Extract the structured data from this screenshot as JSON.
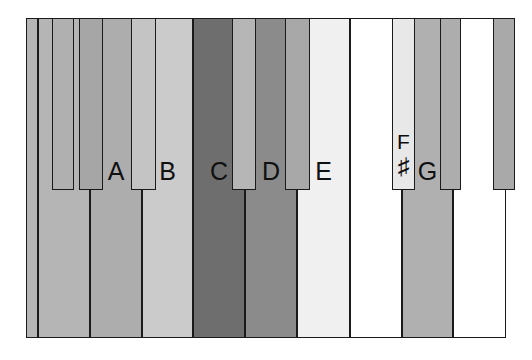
{
  "diagram": {
    "type": "piano-keyboard",
    "background_color": "#ffffff",
    "outline_color": "#1a1a1a",
    "geometry": {
      "image_width": 532,
      "image_height": 360,
      "keyboard_left": 26,
      "keyboard_right": 506,
      "keyboard_top": 18,
      "keyboard_bottom": 338,
      "black_key_bottom": 190
    },
    "white_keys": [
      {
        "id": "wk-0",
        "label": "",
        "x": 26,
        "y": 18,
        "width": 12,
        "height": 320,
        "color": "#b5b5b5"
      },
      {
        "id": "wk-1",
        "label": "G",
        "x": 38,
        "y": 18,
        "width": 52,
        "height": 320,
        "color": "#b5b5b5"
      },
      {
        "id": "wk-2",
        "label": "A",
        "x": 90,
        "y": 18,
        "width": 52,
        "height": 320,
        "color": "#adadad"
      },
      {
        "id": "wk-3",
        "label": "B",
        "x": 142,
        "y": 18,
        "width": 51,
        "height": 320,
        "color": "#cbcbcb"
      },
      {
        "id": "wk-4",
        "label": "C",
        "x": 193,
        "y": 18,
        "width": 52,
        "height": 320,
        "color": "#6e6e6e"
      },
      {
        "id": "wk-5",
        "label": "D",
        "x": 245,
        "y": 18,
        "width": 52,
        "height": 320,
        "color": "#8b8b8b"
      },
      {
        "id": "wk-6",
        "label": "E",
        "x": 297,
        "y": 18,
        "width": 53,
        "height": 320,
        "color": "#f0f0f0"
      },
      {
        "id": "wk-7",
        "label": "",
        "x": 350,
        "y": 18,
        "width": 52,
        "height": 320,
        "color": "#ffffff"
      },
      {
        "id": "wk-8",
        "label": "G",
        "x": 402,
        "y": 18,
        "width": 51,
        "height": 320,
        "color": "#b0b0b0"
      },
      {
        "id": "wk-9",
        "label": "",
        "x": 453,
        "y": 18,
        "width": 53,
        "height": 320,
        "color": "#ffffff"
      }
    ],
    "black_keys": [
      {
        "id": "bk-0",
        "label": "",
        "sharp": "",
        "x": 52,
        "y": 18,
        "width": 22,
        "height": 172,
        "color": "#b0b0b0"
      },
      {
        "id": "bk-1",
        "label": "",
        "sharp": "",
        "x": 79,
        "y": 18,
        "width": 24,
        "height": 172,
        "color": "#a6a6a6"
      },
      {
        "id": "bk-2",
        "label": "",
        "sharp": "",
        "x": 131,
        "y": 18,
        "width": 25,
        "height": 172,
        "color": "#c4c4c4"
      },
      {
        "id": "bk-3",
        "label": "",
        "sharp": "",
        "x": 232,
        "y": 18,
        "width": 24,
        "height": 172,
        "color": "#b6b6b6"
      },
      {
        "id": "bk-4",
        "label": "",
        "sharp": "",
        "x": 285,
        "y": 18,
        "width": 25,
        "height": 172,
        "color": "#a8a8a8"
      },
      {
        "id": "bk-5",
        "label": "F",
        "sharp": "♯",
        "x": 392,
        "y": 18,
        "width": 23,
        "height": 172,
        "color": "#e8e8e8"
      },
      {
        "id": "bk-6",
        "label": "",
        "sharp": "",
        "x": 440,
        "y": 18,
        "width": 21,
        "height": 172,
        "color": "#adadad"
      },
      {
        "id": "bk-7",
        "label": "",
        "sharp": "",
        "x": 493,
        "y": 18,
        "width": 22,
        "height": 172,
        "color": "#a9a9a9"
      }
    ],
    "note_labels_visible": [
      "G",
      "A",
      "B",
      "C",
      "D",
      "E",
      "F♯",
      "G"
    ]
  }
}
